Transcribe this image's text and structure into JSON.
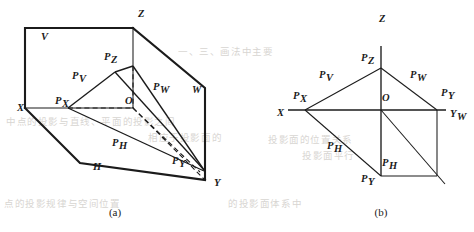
{
  "figure": {
    "captions": {
      "a": "(a)",
      "b": "(b)"
    },
    "colors": {
      "ink": "#1b1b1b",
      "paper": "#ffffff",
      "bleed_text": "#b9b4ae"
    }
  },
  "diagram_a": {
    "name": "pictorial-view",
    "caption": "(a)",
    "axis_labels": [
      {
        "id": "x-axis-label",
        "base": "X",
        "sub": "",
        "x": 17,
        "y": 111
      },
      {
        "id": "y-axis-label",
        "base": "Y",
        "sub": "",
        "x": 214,
        "y": 186
      },
      {
        "id": "z-axis-label",
        "base": "Z",
        "sub": "",
        "x": 138,
        "y": 17
      }
    ],
    "plane_labels": [
      {
        "id": "plane-v",
        "base": "V",
        "sub": "",
        "x": 41,
        "y": 40
      },
      {
        "id": "plane-h",
        "base": "H",
        "sub": "",
        "x": 93,
        "y": 170
      },
      {
        "id": "plane-w",
        "base": "W",
        "sub": "",
        "x": 192,
        "y": 93
      }
    ],
    "point_labels": [
      {
        "id": "point-pz",
        "base": "P",
        "sub": "Z",
        "x": 104,
        "y": 60
      },
      {
        "id": "point-pv",
        "base": "P",
        "sub": "V",
        "x": 72,
        "y": 79
      },
      {
        "id": "point-pw",
        "base": "P",
        "sub": "W",
        "x": 153,
        "y": 90
      },
      {
        "id": "point-px",
        "base": "P",
        "sub": "X",
        "x": 55,
        "y": 104
      },
      {
        "id": "point-o",
        "base": "O",
        "sub": "",
        "x": 125,
        "y": 104
      },
      {
        "id": "point-ph",
        "base": "P",
        "sub": "H",
        "x": 112,
        "y": 146
      },
      {
        "id": "point-py",
        "base": "P",
        "sub": "Y",
        "x": 172,
        "y": 164
      }
    ]
  },
  "diagram_b": {
    "name": "unfolded-view",
    "caption": "(b)",
    "axis_labels": [
      {
        "id": "x-axis-label",
        "base": "X",
        "sub": "",
        "x": 277,
        "y": 116
      },
      {
        "id": "z-axis-label",
        "base": "Z",
        "sub": "",
        "x": 379,
        "y": 22
      },
      {
        "id": "yw-axis-label",
        "base": "Y",
        "sub": "W",
        "x": 450,
        "y": 117
      }
    ],
    "point_labels": [
      {
        "id": "point-pz",
        "base": "P",
        "sub": "Z",
        "x": 361,
        "y": 61
      },
      {
        "id": "point-pv",
        "base": "P",
        "sub": "V",
        "x": 319,
        "y": 78
      },
      {
        "id": "point-pw",
        "base": "P",
        "sub": "W",
        "x": 410,
        "y": 78
      },
      {
        "id": "point-px",
        "base": "P",
        "sub": "X",
        "x": 293,
        "y": 99
      },
      {
        "id": "point-o",
        "base": "O",
        "sub": "",
        "x": 382,
        "y": 101
      },
      {
        "id": "point-pyw",
        "base": "P",
        "sub": "Y",
        "x": 441,
        "y": 96
      },
      {
        "id": "point-ph",
        "base": "P",
        "sub": "H",
        "x": 327,
        "y": 149
      },
      {
        "id": "point-ph2",
        "base": "P",
        "sub": "H",
        "x": 382,
        "y": 166
      },
      {
        "id": "point-py",
        "base": "P",
        "sub": "Y",
        "x": 361,
        "y": 182
      }
    ]
  },
  "bleed_text": [
    {
      "id": "bleed-1",
      "text": "一、三、画法中主要",
      "x": 178,
      "y": 44,
      "size": 9.5
    },
    {
      "id": "bleed-2",
      "text": "中点的投影与直线、平面的投影之间",
      "x": 6,
      "y": 114,
      "size": 9.5
    },
    {
      "id": "bleed-3",
      "text": "相应于投影面的",
      "x": 148,
      "y": 130,
      "size": 9.5
    },
    {
      "id": "bleed-4",
      "text": "投影面的位置关系",
      "x": 268,
      "y": 132,
      "size": 9.5
    },
    {
      "id": "bleed-5",
      "text": "投影面平行",
      "x": 302,
      "y": 148,
      "size": 9.5
    },
    {
      "id": "bleed-6",
      "text": "点的投影规律与空间位置",
      "x": 4,
      "y": 196,
      "size": 9.5
    },
    {
      "id": "bleed-7",
      "text": "的投影面体系中",
      "x": 228,
      "y": 196,
      "size": 9.5
    }
  ]
}
